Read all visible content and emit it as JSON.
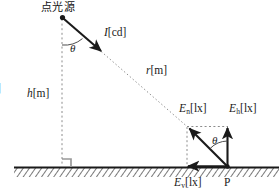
{
  "figure": {
    "title_label": "点光源",
    "source_point_name": "point-light-source",
    "labels": {
      "source": "点光源",
      "intensity": {
        "symbol": "I",
        "sub": "",
        "unit": "[cd]"
      },
      "distance": {
        "symbol": "r",
        "sub": "",
        "unit": "[m]"
      },
      "height": {
        "symbol": "h",
        "sub": "",
        "unit": "[m]"
      },
      "normal_illuminance": {
        "symbol": "E",
        "sub": "n",
        "unit": "[lx]"
      },
      "horizontal_illuminance": {
        "symbol": "E",
        "sub": "h",
        "unit": "[lx]"
      },
      "vertical_illuminance": {
        "symbol": "E",
        "sub": "v",
        "unit": "[lx]"
      },
      "angle_top": "θ",
      "angle_bottom": "θ",
      "point_p": "P",
      "clipped_left": "]"
    },
    "colors": {
      "stroke": "#1a1a1a",
      "dashed": "#8c8c8c",
      "ground_hatch": "#4d4d4d",
      "background": "#ffffff",
      "right_angle_marker": "#999999"
    },
    "geometry": {
      "source": {
        "x": 62,
        "y": 17
      },
      "point_p": {
        "x": 228,
        "y": 167
      },
      "ground_y": 167,
      "normal_vector_tip": {
        "x": 187,
        "y": 127
      },
      "vertical_foot": {
        "x": 187,
        "y": 167
      },
      "horizontal_tip": {
        "x": 228,
        "y": 127
      },
      "ray_arrow_end": {
        "x": 103,
        "y": 53
      },
      "angle_top_deg": 48,
      "angle_bottom_deg": 45
    }
  }
}
